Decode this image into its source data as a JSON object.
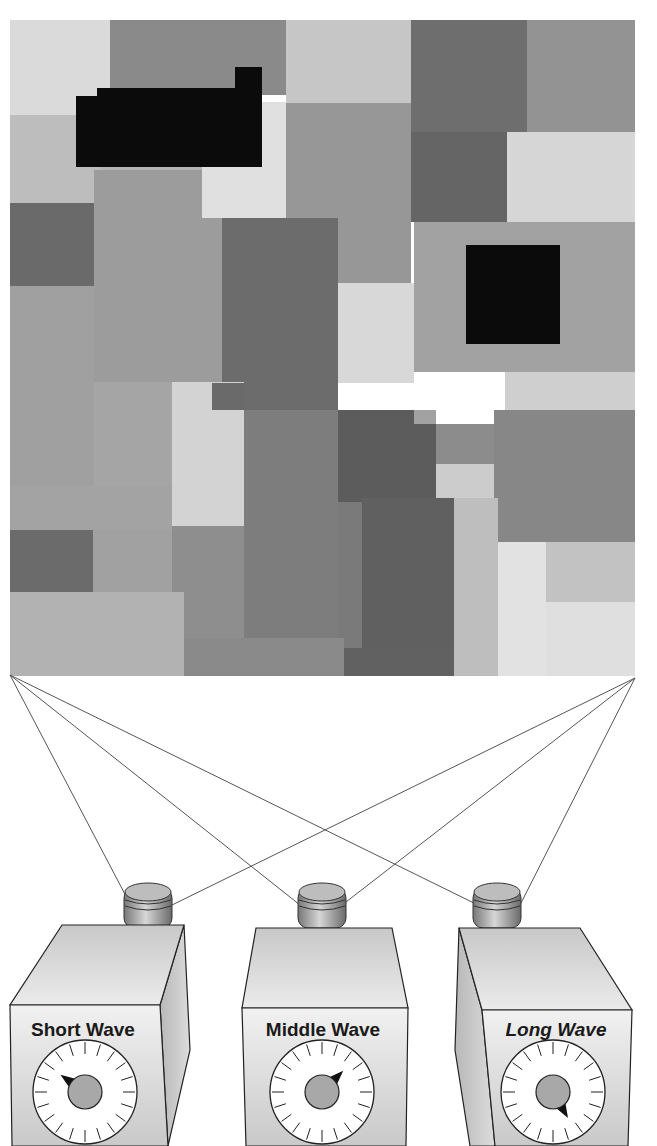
{
  "diagram": {
    "mondrian": {
      "x": 10,
      "y": 20,
      "width": 625,
      "height": 655,
      "patches": [
        {
          "x": 10,
          "y": 20,
          "w": 100,
          "h": 95,
          "fill": "#dadada"
        },
        {
          "x": 110,
          "y": 20,
          "w": 176,
          "h": 75,
          "fill": "#8a8a8a"
        },
        {
          "x": 286,
          "y": 20,
          "w": 125,
          "h": 83,
          "fill": "#c6c6c6"
        },
        {
          "x": 411,
          "y": 20,
          "w": 116,
          "h": 112,
          "fill": "#6e6e6e"
        },
        {
          "x": 527,
          "y": 20,
          "w": 108,
          "h": 112,
          "fill": "#939393"
        },
        {
          "x": 10,
          "y": 115,
          "w": 90,
          "h": 88,
          "fill": "#bdbdbd"
        },
        {
          "x": 100,
          "y": 115,
          "w": 186,
          "h": 55,
          "fill": "#b4b4b4"
        },
        {
          "x": 286,
          "y": 103,
          "w": 125,
          "h": 180,
          "fill": "#979797"
        },
        {
          "x": 411,
          "y": 132,
          "w": 96,
          "h": 90,
          "fill": "#656565"
        },
        {
          "x": 507,
          "y": 132,
          "w": 128,
          "h": 90,
          "fill": "#d6d6d6"
        },
        {
          "x": 10,
          "y": 203,
          "w": 84,
          "h": 83,
          "fill": "#6a6a6a"
        },
        {
          "x": 94,
          "y": 170,
          "w": 128,
          "h": 212,
          "fill": "#9c9c9c"
        },
        {
          "x": 202,
          "y": 102,
          "w": 84,
          "h": 116,
          "fill": "#e0e0e0"
        },
        {
          "x": 222,
          "y": 218,
          "w": 116,
          "h": 192,
          "fill": "#6c6c6c"
        },
        {
          "x": 338,
          "y": 283,
          "w": 76,
          "h": 100,
          "fill": "#d8d8d8"
        },
        {
          "x": 414,
          "y": 222,
          "w": 221,
          "h": 150,
          "fill": "#a2a2a2"
        },
        {
          "x": 505,
          "y": 372,
          "w": 130,
          "h": 38,
          "fill": "#cfcfcf"
        },
        {
          "x": 10,
          "y": 286,
          "w": 84,
          "h": 200,
          "fill": "#a0a0a0"
        },
        {
          "x": 94,
          "y": 382,
          "w": 78,
          "h": 104,
          "fill": "#a5a5a5"
        },
        {
          "x": 172,
          "y": 382,
          "w": 72,
          "h": 144,
          "fill": "#d3d3d3"
        },
        {
          "x": 212,
          "y": 383,
          "w": 32,
          "h": 27,
          "fill": "#6a6a6a"
        },
        {
          "x": 244,
          "y": 410,
          "w": 94,
          "h": 238,
          "fill": "#7d7d7d"
        },
        {
          "x": 338,
          "y": 410,
          "w": 98,
          "h": 92,
          "fill": "#5c5c5c"
        },
        {
          "x": 414,
          "y": 410,
          "w": 22,
          "h": 14,
          "fill": "#a2a2a2"
        },
        {
          "x": 436,
          "y": 424,
          "w": 58,
          "h": 40,
          "fill": "#8c8c8c"
        },
        {
          "x": 436,
          "y": 464,
          "w": 58,
          "h": 34,
          "fill": "#cccccc"
        },
        {
          "x": 494,
          "y": 410,
          "w": 141,
          "h": 132,
          "fill": "#878787"
        },
        {
          "x": 10,
          "y": 486,
          "w": 162,
          "h": 44,
          "fill": "#a3a3a3"
        },
        {
          "x": 10,
          "y": 530,
          "w": 83,
          "h": 82,
          "fill": "#6b6b6b"
        },
        {
          "x": 93,
          "y": 530,
          "w": 79,
          "h": 62,
          "fill": "#a1a1a1"
        },
        {
          "x": 172,
          "y": 526,
          "w": 72,
          "h": 112,
          "fill": "#8e8e8e"
        },
        {
          "x": 362,
          "y": 498,
          "w": 92,
          "h": 178,
          "fill": "#606060"
        },
        {
          "x": 338,
          "y": 502,
          "w": 24,
          "h": 146,
          "fill": "#7a7a7a"
        },
        {
          "x": 454,
          "y": 498,
          "w": 44,
          "h": 178,
          "fill": "#bebebe"
        },
        {
          "x": 498,
          "y": 542,
          "w": 48,
          "h": 134,
          "fill": "#e2e2e2"
        },
        {
          "x": 546,
          "y": 542,
          "w": 89,
          "h": 60,
          "fill": "#c2c2c2"
        },
        {
          "x": 546,
          "y": 602,
          "w": 89,
          "h": 74,
          "fill": "#dfdfdf"
        },
        {
          "x": 10,
          "y": 592,
          "w": 174,
          "h": 84,
          "fill": "#b2b2b2"
        },
        {
          "x": 184,
          "y": 638,
          "w": 160,
          "h": 38,
          "fill": "#8a8a8a"
        },
        {
          "x": 344,
          "y": 648,
          "w": 110,
          "h": 28,
          "fill": "#616161"
        },
        {
          "x": 76,
          "y": 96,
          "w": 186,
          "h": 71,
          "fill": "#0b0b0b"
        },
        {
          "x": 97,
          "y": 88,
          "w": 165,
          "h": 10,
          "fill": "#0b0b0b"
        },
        {
          "x": 235,
          "y": 67,
          "w": 27,
          "h": 25,
          "fill": "#0b0b0b"
        },
        {
          "x": 466,
          "y": 245,
          "w": 94,
          "h": 99,
          "fill": "#0b0b0b"
        }
      ]
    },
    "sight_lines": {
      "color": "#555555",
      "left_corner": {
        "x": 10,
        "y": 675
      },
      "right_corner": {
        "x": 635,
        "y": 678
      },
      "targets_from_left": [
        {
          "x": 128,
          "y": 900
        },
        {
          "x": 300,
          "y": 905
        },
        {
          "x": 478,
          "y": 905
        }
      ],
      "targets_from_right": [
        {
          "x": 172,
          "y": 905
        },
        {
          "x": 346,
          "y": 902
        },
        {
          "x": 520,
          "y": 905
        }
      ]
    },
    "cameras": [
      {
        "id": "short",
        "label": "Short Wave",
        "label_italic": false,
        "pointer_angle_deg": 215,
        "x": 10
      },
      {
        "id": "middle",
        "label": "Middle Wave",
        "label_italic": false,
        "pointer_angle_deg": 315,
        "x": 232
      },
      {
        "id": "long",
        "label": "Long Wave",
        "label_italic": true,
        "pointer_angle_deg": 60,
        "x": 455
      }
    ]
  }
}
